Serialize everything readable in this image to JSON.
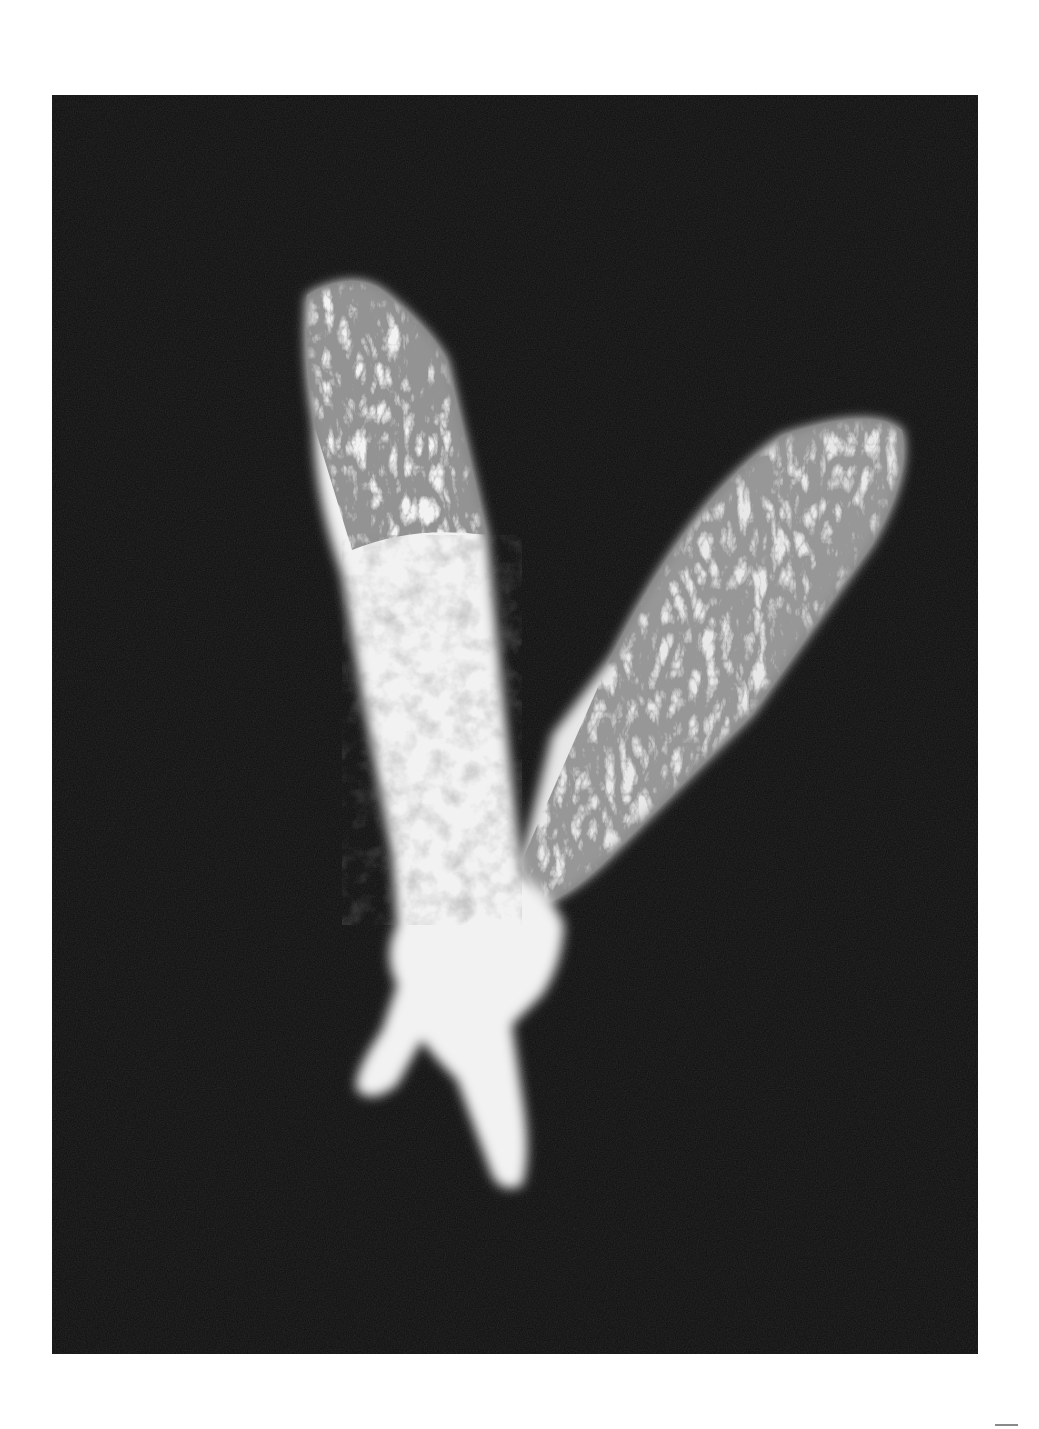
{
  "page": {
    "background": "#ffffff"
  },
  "photo": {
    "description": "Black-and-white photogram of two forearms forming a V shape, filled with foliage and leaf textures on a black background",
    "background_color": "#0d0d0d",
    "subject_color": "#f2f2f2",
    "left_arm": "Vertical arm with fingertips pointing down, upper portion filled with dark grass/plant texture",
    "right_arm": "Diagonal arm angled toward upper right, filled with leaves and branches"
  },
  "page_mark": {
    "color": "#8a8a8a"
  }
}
